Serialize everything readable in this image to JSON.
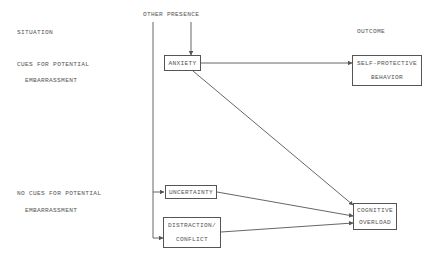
{
  "headers": {
    "situation": "SITUATION",
    "other_presence": "OTHER PRESENCE",
    "outcome": "OUTCOME"
  },
  "situations": [
    {
      "line1": "CUES FOR POTENTIAL",
      "line2": "EMBARRASSMENT"
    },
    {
      "line1": "NO CUES FOR POTENTIAL",
      "line2": "EMBARRASSMENT"
    }
  ],
  "nodes": {
    "anxiety": {
      "line1": "ANXIETY"
    },
    "self_protective": {
      "line1": "SELF-PROTECTIVE",
      "line2": "BEHAVIOR"
    },
    "uncertainty": {
      "line1": "UNCERTAINTY"
    },
    "distraction": {
      "line1": "DISTRACTION/",
      "line2": "CONFLICT"
    },
    "cognitive_overload": {
      "line1": "COGNITIVE",
      "line2": "OVERLOAD"
    }
  },
  "edges": [
    {
      "from": "other_presence",
      "to": "anxiety"
    },
    {
      "from": "other_presence",
      "to": "uncertainty"
    },
    {
      "from": "other_presence",
      "to": "distraction"
    },
    {
      "from": "anxiety",
      "to": "self_protective"
    },
    {
      "from": "anxiety",
      "to": "cognitive_overload"
    },
    {
      "from": "uncertainty",
      "to": "cognitive_overload"
    },
    {
      "from": "distraction",
      "to": "cognitive_overload"
    }
  ],
  "colors": {
    "line": "#555555",
    "text": "#555555",
    "background": "#ffffff"
  }
}
